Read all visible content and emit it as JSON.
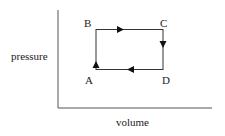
{
  "diagram": {
    "type": "pv-cycle",
    "axes": {
      "xlabel": "volume",
      "ylabel": "pressure"
    },
    "points": [
      {
        "label": "A",
        "position": "bottom-left"
      },
      {
        "label": "B",
        "position": "top-left"
      },
      {
        "label": "C",
        "position": "top-right"
      },
      {
        "label": "D",
        "position": "bottom-right"
      }
    ],
    "path": [
      {
        "from": "A",
        "to": "B",
        "direction": "up"
      },
      {
        "from": "B",
        "to": "C",
        "direction": "right"
      },
      {
        "from": "C",
        "to": "D",
        "direction": "down"
      },
      {
        "from": "D",
        "to": "A",
        "direction": "left"
      }
    ],
    "colors": {
      "line": "#333333",
      "axis": "#555555",
      "text": "#222222"
    }
  }
}
